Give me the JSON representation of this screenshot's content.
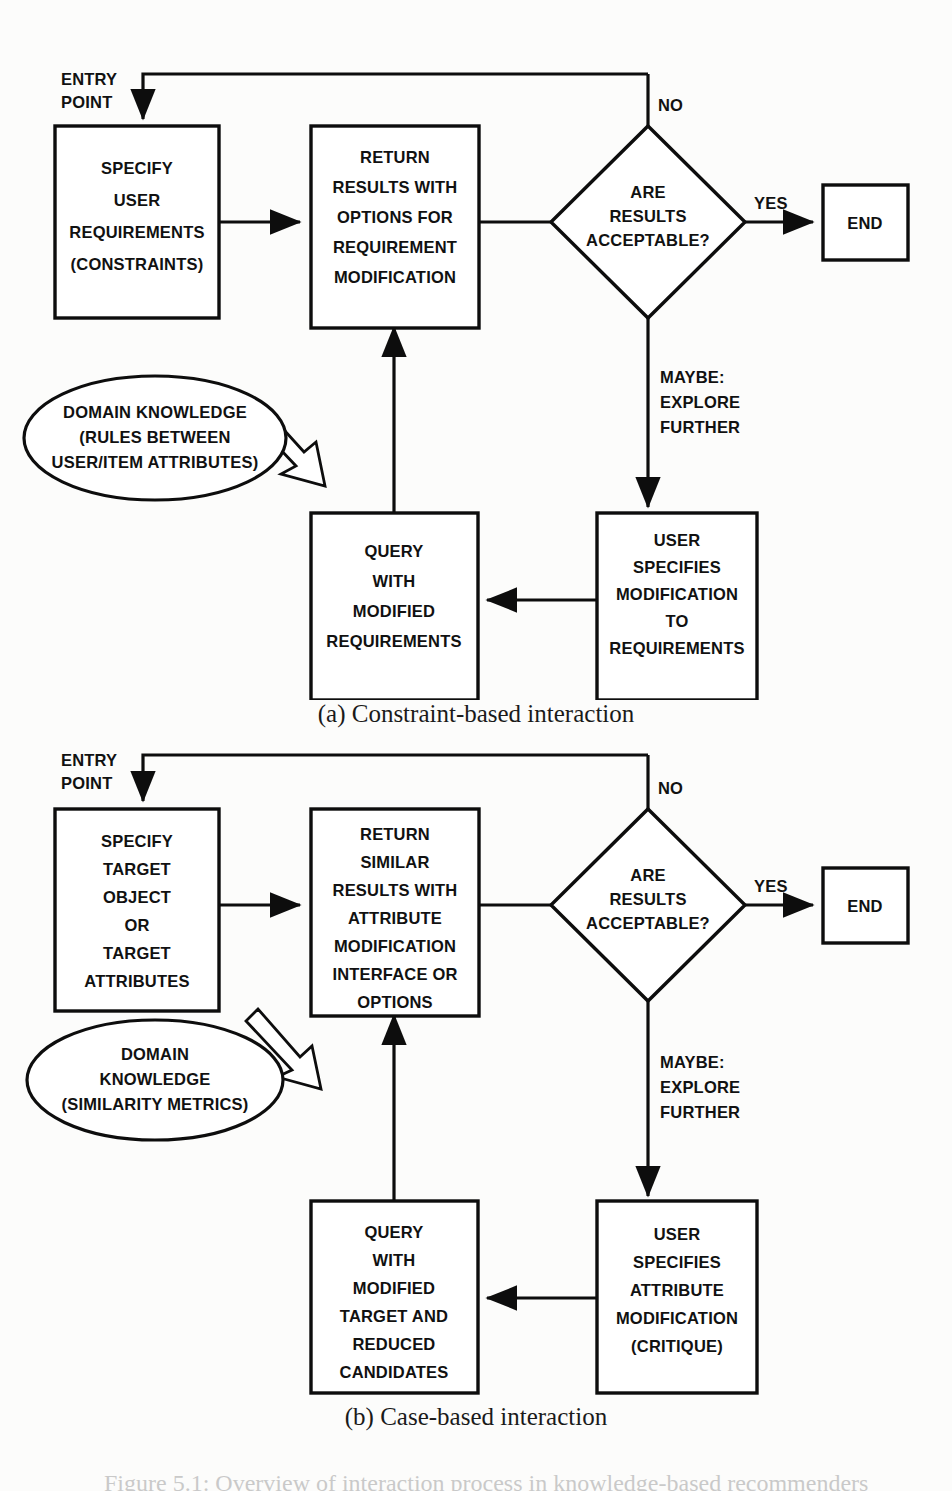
{
  "figure": {
    "caption": "Figure 5.1: Overview of interaction process in knowledge-based recommenders",
    "subcaption_a": "(a) Constraint-based interaction",
    "subcaption_b": "(b) Case-based interaction"
  },
  "colors": {
    "stroke": "#0d0d0d",
    "fill": "#ffffff",
    "background": "#fcfcfb",
    "text": "#111111"
  },
  "diagram_a": {
    "title": "Constraint-based interaction",
    "nodes": {
      "specify": {
        "shape": "box",
        "lines": [
          "SPECIFY",
          "USER",
          "REQUIREMENTS",
          "(CONSTRAINTS)"
        ]
      },
      "return": {
        "shape": "box",
        "lines": [
          "RETURN",
          "RESULTS WITH",
          "OPTIONS FOR",
          "REQUIREMENT",
          "MODIFICATION"
        ]
      },
      "decision": {
        "shape": "diamond",
        "lines": [
          "ARE",
          "RESULTS",
          "ACCEPTABLE?"
        ]
      },
      "end": {
        "shape": "box",
        "lines": [
          "END"
        ]
      },
      "knowledge": {
        "shape": "ellipse",
        "lines": [
          "DOMAIN KNOWLEDGE",
          "(RULES BETWEEN",
          "USER/ITEM ATTRIBUTES)"
        ]
      },
      "query": {
        "shape": "box",
        "lines": [
          "QUERY",
          "WITH",
          "MODIFIED",
          "REQUIREMENTS"
        ]
      },
      "usermod": {
        "shape": "box",
        "lines": [
          "USER",
          "SPECIFIES",
          "MODIFICATION",
          "TO",
          "REQUIREMENTS"
        ]
      }
    },
    "labels": {
      "entry": [
        "ENTRY",
        "POINT"
      ],
      "no": "NO",
      "yes": "YES",
      "maybe": [
        "MAYBE:",
        "EXPLORE",
        "FURTHER"
      ]
    }
  },
  "diagram_b": {
    "title": "Case-based interaction",
    "nodes": {
      "specify": {
        "shape": "box",
        "lines": [
          "SPECIFY",
          "TARGET",
          "OBJECT",
          "OR",
          "TARGET",
          "ATTRIBUTES"
        ]
      },
      "return": {
        "shape": "box",
        "lines": [
          "RETURN",
          "SIMILAR",
          "RESULTS WITH",
          "ATTRIBUTE",
          "MODIFICATION",
          "INTERFACE OR",
          "OPTIONS"
        ]
      },
      "decision": {
        "shape": "diamond",
        "lines": [
          "ARE",
          "RESULTS",
          "ACCEPTABLE?"
        ]
      },
      "end": {
        "shape": "box",
        "lines": [
          "END"
        ]
      },
      "knowledge": {
        "shape": "ellipse",
        "lines": [
          "DOMAIN",
          "KNOWLEDGE",
          "(SIMILARITY METRICS)"
        ]
      },
      "query": {
        "shape": "box",
        "lines": [
          "QUERY",
          "WITH",
          "MODIFIED",
          "TARGET AND",
          "REDUCED",
          "CANDIDATES"
        ]
      },
      "usermod": {
        "shape": "box",
        "lines": [
          "USER",
          "SPECIFIES",
          "ATTRIBUTE",
          "MODIFICATION",
          "(CRITIQUE)"
        ]
      }
    },
    "labels": {
      "entry": [
        "ENTRY",
        "POINT"
      ],
      "no": "NO",
      "yes": "YES",
      "maybe": [
        "MAYBE:",
        "EXPLORE",
        "FURTHER"
      ]
    }
  }
}
